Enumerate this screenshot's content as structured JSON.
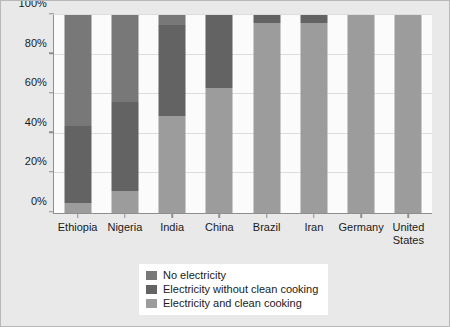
{
  "chart_data": {
    "type": "bar",
    "variant": "stacked-100-percent",
    "title": "",
    "subtitle": "",
    "xlabel": "",
    "ylabel": "",
    "categories": [
      "Ethiopia",
      "Nigeria",
      "India",
      "China",
      "Brazil",
      "Iran",
      "Germany",
      "United States"
    ],
    "category_labels_wrapped": [
      "Ethiopia",
      "Nigeria",
      "India",
      "China",
      "Brazil",
      "Iran",
      "Germany",
      "United\nStates"
    ],
    "series": [
      {
        "name": "Electricity and clean cooking",
        "color": "#9c9c9c",
        "values": [
          5,
          11,
          49,
          63,
          96,
          96,
          100,
          100
        ]
      },
      {
        "name": "Electricity without clean cooking",
        "color": "#636363",
        "values": [
          39,
          45,
          46,
          37,
          4,
          4,
          0,
          0
        ]
      },
      {
        "name": "No electricity",
        "color": "#787878",
        "values": [
          56,
          44,
          5,
          0,
          0,
          0,
          0,
          0
        ]
      }
    ],
    "stack_order_bottom_to_top": [
      "Electricity and clean cooking",
      "Electricity without clean cooking",
      "No electricity"
    ],
    "ylim": [
      0,
      100
    ],
    "yticks": [
      0,
      20,
      40,
      60,
      80,
      100
    ],
    "ytick_labels": [
      "0%",
      "20%",
      "40%",
      "60%",
      "80%",
      "100%"
    ],
    "grid": true,
    "grid_axis": "y",
    "legend_position": "below-center",
    "legend_entries": [
      {
        "label": "No electricity",
        "color": "#787878"
      },
      {
        "label": "Electricity without clean cooking",
        "color": "#636363"
      },
      {
        "label": "Electricity and clean cooking",
        "color": "#9c9c9c"
      }
    ]
  },
  "figure": {
    "background": "#e9e9e9",
    "plot_background": "#fbfbfb",
    "axis_color": "#8e8e8e",
    "grid_color": "#dddddd",
    "text_color": "#1a1a1a",
    "legend_background": "#ffffff"
  }
}
